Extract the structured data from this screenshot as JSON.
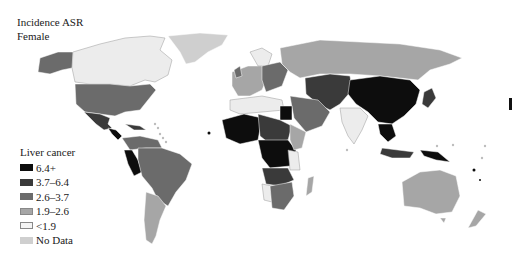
{
  "title": {
    "line1": "Incidence ASR",
    "line2": "Female"
  },
  "legend": {
    "title": "Liver cancer",
    "items": [
      {
        "label": "6.4+",
        "color": "#0d0d0d"
      },
      {
        "label": "3.7–6.4",
        "color": "#3a3a3a"
      },
      {
        "label": "2.6–3.7",
        "color": "#6b6b6b"
      },
      {
        "label": "1.9–2.6",
        "color": "#a6a6a6"
      },
      {
        "label": "<1.9",
        "color": "#ececec"
      },
      {
        "label": "No Data",
        "color": "#cfcfcf"
      }
    ]
  },
  "map": {
    "regions": [
      {
        "name": "Alaska",
        "class": "2.6–3.7"
      },
      {
        "name": "Canada",
        "class": "<1.9"
      },
      {
        "name": "Greenland",
        "class": "No Data"
      },
      {
        "name": "United States",
        "class": "2.6–3.7"
      },
      {
        "name": "Mexico",
        "class": "3.7–6.4"
      },
      {
        "name": "Central America",
        "class": "6.4+"
      },
      {
        "name": "Brazil",
        "class": "2.6–3.7"
      },
      {
        "name": "Peru",
        "class": "6.4+"
      },
      {
        "name": "Argentina",
        "class": "1.9–2.6"
      },
      {
        "name": "Russia",
        "class": "1.9–2.6"
      },
      {
        "name": "Kazakhstan/Mongolia",
        "class": "3.7–6.4"
      },
      {
        "name": "China",
        "class": "6.4+"
      },
      {
        "name": "India",
        "class": "<1.9"
      },
      {
        "name": "Japan",
        "class": "3.7–6.4"
      },
      {
        "name": "Southeast Asia",
        "class": "6.4+"
      },
      {
        "name": "Papua New Guinea",
        "class": "6.4+"
      },
      {
        "name": "Australia",
        "class": "1.9–2.6"
      },
      {
        "name": "New Zealand",
        "class": "1.9–2.6"
      },
      {
        "name": "West Africa",
        "class": "6.4+"
      },
      {
        "name": "Central Africa",
        "class": "6.4+"
      },
      {
        "name": "Egypt",
        "class": "6.4+"
      },
      {
        "name": "Southern Africa",
        "class": "2.6–3.7"
      },
      {
        "name": "Madagascar",
        "class": "1.9–2.6"
      },
      {
        "name": "Europe",
        "class": "mixed"
      },
      {
        "name": "Middle East",
        "class": "2.6–3.7"
      }
    ]
  }
}
